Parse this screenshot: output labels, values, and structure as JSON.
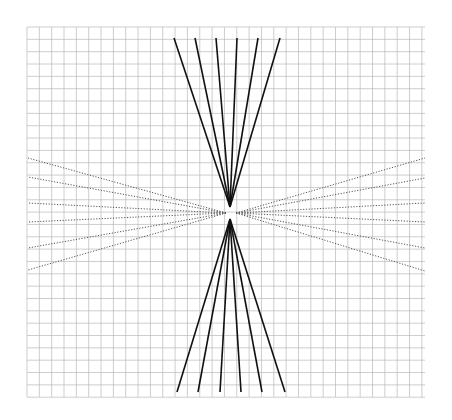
{
  "figure": {
    "background_color": "#ffffff",
    "width": 452,
    "height": 420
  },
  "grid": {
    "name": "graph-paper-grid",
    "x0": 27,
    "y0": 27,
    "x1": 425,
    "y1": 397,
    "cell_size": 12.34,
    "columns": 32,
    "rows": 30,
    "line_color": "#b9b9b9",
    "line_width": 0.7,
    "minor_line_color": "#dcdcdc",
    "minor_line_width": 0.5
  },
  "vanishing_points": {
    "top": {
      "x": 230,
      "y": 207
    },
    "bottom": {
      "x": 230,
      "y": 219
    },
    "left": {
      "x": 226,
      "y": 213
    },
    "right": {
      "x": 236,
      "y": 213
    }
  },
  "chart_data": {
    "type": "line",
    "subtitle": "",
    "xlabel": "",
    "ylabel": "",
    "xlim": [
      27,
      425
    ],
    "ylim": [
      27,
      397
    ],
    "grid": true,
    "legend": "none",
    "annotations": [],
    "series": [
      {
        "name": "top-fan",
        "style": "solid",
        "color": "#111111",
        "width": 1.6,
        "apex": [
          230,
          207
        ],
        "endpoints": [
          [
            174,
            38
          ],
          [
            195,
            38
          ],
          [
            216,
            38
          ],
          [
            237,
            38
          ],
          [
            258,
            38
          ],
          [
            280,
            38
          ]
        ]
      },
      {
        "name": "bottom-fan",
        "style": "solid",
        "color": "#111111",
        "width": 1.6,
        "apex": [
          230,
          219
        ],
        "endpoints": [
          [
            177,
            392
          ],
          [
            198,
            392
          ],
          [
            220,
            392
          ],
          [
            241,
            392
          ],
          [
            262,
            392
          ],
          [
            285,
            392
          ]
        ]
      },
      {
        "name": "left-fan",
        "style": "dotted",
        "color": "#555555",
        "width": 1.0,
        "apex": [
          226,
          213
        ],
        "endpoints": [
          [
            28,
            158
          ],
          [
            28,
            177
          ],
          [
            28,
            203
          ],
          [
            28,
            222
          ],
          [
            28,
            248
          ],
          [
            28,
            270
          ]
        ]
      },
      {
        "name": "right-fan",
        "style": "dotted",
        "color": "#555555",
        "width": 1.0,
        "apex": [
          236,
          213
        ],
        "endpoints": [
          [
            425,
            158
          ],
          [
            425,
            178
          ],
          [
            425,
            203
          ],
          [
            425,
            222
          ],
          [
            425,
            248
          ],
          [
            425,
            271
          ]
        ]
      }
    ]
  }
}
